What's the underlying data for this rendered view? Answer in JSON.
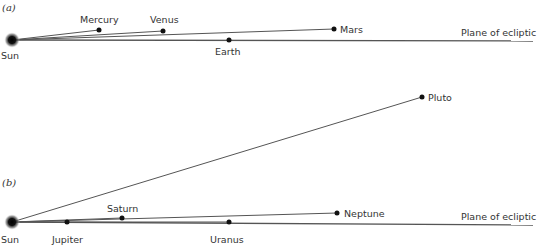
{
  "colors": {
    "line": "#555555",
    "dot": "#111111",
    "text": "#333333",
    "background": "#ffffff"
  },
  "panels": [
    {
      "id": "a",
      "label": "(a)",
      "sun": {
        "label": "Sun",
        "x": 12,
        "y": 40
      },
      "ecliptic": {
        "label": "Plane of ecliptic",
        "x2": 533,
        "y2": 41
      },
      "planets": [
        {
          "name": "Mercury",
          "x": 99,
          "y": 30
        },
        {
          "name": "Venus",
          "x": 163,
          "y": 31
        },
        {
          "name": "Earth",
          "x": 229,
          "y": 40
        },
        {
          "name": "Mars",
          "x": 334,
          "y": 29
        }
      ]
    },
    {
      "id": "b",
      "label": "(b)",
      "sun": {
        "label": "Sun",
        "x": 12,
        "y": 222
      },
      "ecliptic": {
        "label": "Plane of ecliptic",
        "x2": 533,
        "y2": 225
      },
      "planets": [
        {
          "name": "Jupiter",
          "x": 67,
          "y": 222
        },
        {
          "name": "Saturn",
          "x": 122,
          "y": 218
        },
        {
          "name": "Uranus",
          "x": 229,
          "y": 222
        },
        {
          "name": "Neptune",
          "x": 337,
          "y": 213
        },
        {
          "name": "Pluto",
          "x": 422,
          "y": 97
        }
      ]
    }
  ]
}
